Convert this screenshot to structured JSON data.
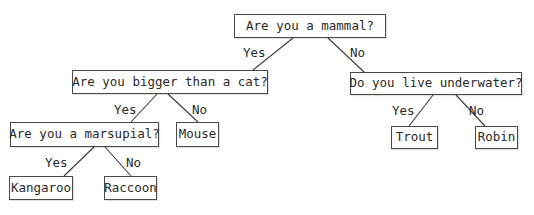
{
  "diagram": {
    "type": "decision-tree",
    "nodes": {
      "root": "Are you a mammal?",
      "bigger": "Are you bigger than a cat?",
      "underwater": "Do you live underwater?",
      "marsupial": "Are you a marsupial?",
      "mouse": "Mouse",
      "trout": "Trout",
      "robin": "Robin",
      "kangaroo": "Kangaroo",
      "raccoon": "Raccoon"
    },
    "edge_labels": {
      "root_yes": "Yes",
      "root_no": "No",
      "bigger_yes": "Yes",
      "bigger_no": "No",
      "underwater_yes": "Yes",
      "underwater_no": "No",
      "marsupial_yes": "Yes",
      "marsupial_no": "No"
    },
    "edges": [
      {
        "from": "Are you a mammal?",
        "to": "Are you bigger than a cat?",
        "label": "Yes"
      },
      {
        "from": "Are you a mammal?",
        "to": "Do you live underwater?",
        "label": "No"
      },
      {
        "from": "Are you bigger than a cat?",
        "to": "Are you a marsupial?",
        "label": "Yes"
      },
      {
        "from": "Are you bigger than a cat?",
        "to": "Mouse",
        "label": "No"
      },
      {
        "from": "Do you live underwater?",
        "to": "Trout",
        "label": "Yes"
      },
      {
        "from": "Do you live underwater?",
        "to": "Robin",
        "label": "No"
      },
      {
        "from": "Are you a marsupial?",
        "to": "Kangaroo",
        "label": "Yes"
      },
      {
        "from": "Are you a marsupial?",
        "to": "Raccoon",
        "label": "No"
      }
    ]
  }
}
